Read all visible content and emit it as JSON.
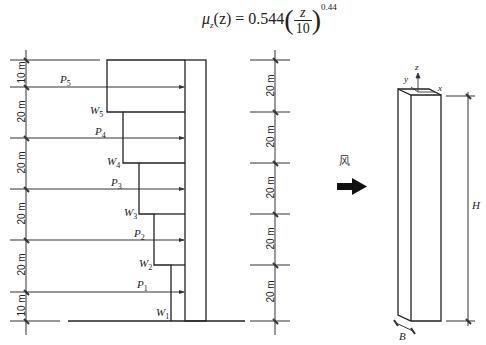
{
  "formula": {
    "lhs_symbol": "μ",
    "lhs_sub": "z",
    "lhs_arg": "(z)",
    "equals": " = ",
    "coefficient": "0.544",
    "frac_num": "z",
    "frac_den": "10",
    "exponent": "0.44"
  },
  "left_dimensions": [
    "10 m",
    "20 m",
    "20 m",
    "20 m",
    "20 m",
    "10 m"
  ],
  "right_dimensions": [
    "20 m",
    "20 m",
    "20 m",
    "20 m",
    "20 m"
  ],
  "loads": [
    {
      "p": "P",
      "p_sub": "5",
      "w": "W",
      "w_sub": "5"
    },
    {
      "p": "P",
      "p_sub": "4",
      "w": "W",
      "w_sub": "4"
    },
    {
      "p": "P",
      "p_sub": "3",
      "w": "W",
      "w_sub": "3"
    },
    {
      "p": "P",
      "p_sub": "2",
      "w": "W",
      "w_sub": "2"
    },
    {
      "p": "P",
      "p_sub": "1",
      "w": "W",
      "w_sub": "1"
    }
  ],
  "wind_label": "风",
  "prism": {
    "axis_x": "x",
    "axis_y": "y",
    "axis_z": "z",
    "height_label": "H",
    "width_label": "B"
  }
}
